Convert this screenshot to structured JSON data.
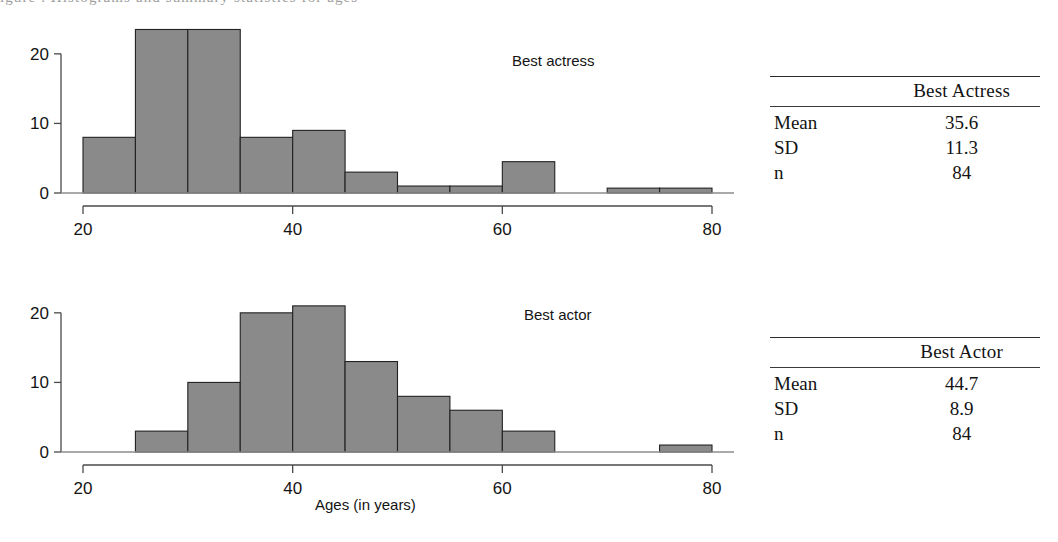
{
  "top_caption_fragment": "igure   .   Histograms and summary statistics for ages",
  "charts": {
    "shared": {
      "x_ticks": [
        20,
        40,
        60,
        80
      ],
      "x_tick_labels": [
        "20",
        "40",
        "60",
        "80"
      ],
      "y_ticks": [
        0,
        10,
        20
      ],
      "y_tick_labels": [
        "0",
        "10",
        "20"
      ],
      "xlim": [
        20,
        80
      ],
      "ylim": [
        0,
        24
      ],
      "bin_width": 5,
      "axis_title": "Ages (in years)",
      "bar_fill": "#8a8a8a",
      "bar_stroke": "#222222",
      "axis_color": "#4a4a4a"
    },
    "actress": {
      "label": "Best actress",
      "table_title": "Best Actress"
    },
    "actor": {
      "label": "Best actor",
      "table_title": "Best Actor"
    }
  },
  "chart_data": [
    {
      "type": "bar",
      "title": "Best actress",
      "xlabel": "Ages (in years)",
      "ylabel": "",
      "xlim": [
        20,
        80
      ],
      "ylim": [
        0,
        24
      ],
      "grid": false,
      "bin_width": 5,
      "bin_starts": [
        20,
        25,
        30,
        35,
        40,
        45,
        50,
        55,
        60,
        65,
        70,
        75
      ],
      "categories": [
        "20-25",
        "25-30",
        "30-35",
        "35-40",
        "40-45",
        "45-50",
        "50-55",
        "55-60",
        "60-65",
        "65-70",
        "70-75",
        "75-80"
      ],
      "values": [
        8,
        23.5,
        23.5,
        8,
        9,
        3,
        1,
        1,
        4.5,
        0,
        0.7,
        0.7
      ],
      "xticks": [
        20,
        40,
        60,
        80
      ],
      "yticks": [
        0,
        10,
        20
      ]
    },
    {
      "type": "bar",
      "title": "Best actor",
      "xlabel": "Ages (in years)",
      "ylabel": "",
      "xlim": [
        20,
        80
      ],
      "ylim": [
        0,
        24
      ],
      "grid": false,
      "bin_width": 5,
      "bin_starts": [
        20,
        25,
        30,
        35,
        40,
        45,
        50,
        55,
        60,
        65,
        70,
        75
      ],
      "categories": [
        "20-25",
        "25-30",
        "30-35",
        "35-40",
        "40-45",
        "45-50",
        "50-55",
        "55-60",
        "60-65",
        "65-70",
        "70-75",
        "75-80"
      ],
      "values": [
        0,
        3,
        10,
        20,
        21,
        13,
        8,
        6,
        3,
        0,
        0,
        1
      ],
      "xticks": [
        20,
        40,
        60,
        80
      ],
      "yticks": [
        0,
        10,
        20
      ]
    }
  ],
  "tables": [
    {
      "header_blank": "",
      "header_title": "Best Actress",
      "rows": [
        {
          "key": "Mean",
          "value": "35.6"
        },
        {
          "key": "SD",
          "value": "11.3"
        },
        {
          "key": "n",
          "value": "84"
        }
      ]
    },
    {
      "header_blank": "",
      "header_title": "Best Actor",
      "rows": [
        {
          "key": "Mean",
          "value": "44.7"
        },
        {
          "key": "SD",
          "value": "8.9"
        },
        {
          "key": "n",
          "value": "84"
        }
      ]
    }
  ]
}
